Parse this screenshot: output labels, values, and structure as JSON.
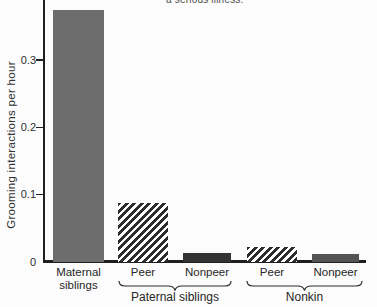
{
  "page": {
    "caption_fragment": "a serious illness."
  },
  "chart_data": {
    "type": "bar",
    "title": "",
    "xlabel": "",
    "ylabel": "Grooming interactions per hour",
    "ylim": [
      0,
      0.4
    ],
    "grid": false,
    "legend": "none",
    "yticks": [
      {
        "value": 0.3,
        "label": "0.3"
      },
      {
        "value": 0.2,
        "label": "0.2"
      },
      {
        "value": 0.1,
        "label": "0.1"
      },
      {
        "value": 0,
        "label": "0"
      }
    ],
    "categories": [
      "Maternal siblings",
      "Peer",
      "Nonpeer",
      "Peer",
      "Nonpeer"
    ],
    "bars": [
      {
        "name": "maternal-siblings",
        "label_lines": [
          "Maternal",
          "siblings"
        ],
        "value": 0.375,
        "fill": "solid",
        "color": "#6d6d6d"
      },
      {
        "name": "paternal-peer",
        "label_lines": [
          "Peer"
        ],
        "value": 0.088,
        "fill": "hatched",
        "color": "#2d2d2d"
      },
      {
        "name": "paternal-nonpeer",
        "label_lines": [
          "Nonpeer"
        ],
        "value": 0.013,
        "fill": "solid",
        "color": "#333333"
      },
      {
        "name": "nonkin-peer",
        "label_lines": [
          "Peer"
        ],
        "value": 0.023,
        "fill": "hatched",
        "color": "#2d2d2d"
      },
      {
        "name": "nonkin-nonpeer",
        "label_lines": [
          "Nonpeer"
        ],
        "value": 0.012,
        "fill": "solid",
        "color": "#545454"
      }
    ],
    "groups": [
      {
        "label": "Paternal siblings",
        "covers": [
          "Peer",
          "Nonpeer"
        ]
      },
      {
        "label": "Nonkin",
        "covers": [
          "Peer",
          "Nonpeer"
        ]
      }
    ]
  }
}
